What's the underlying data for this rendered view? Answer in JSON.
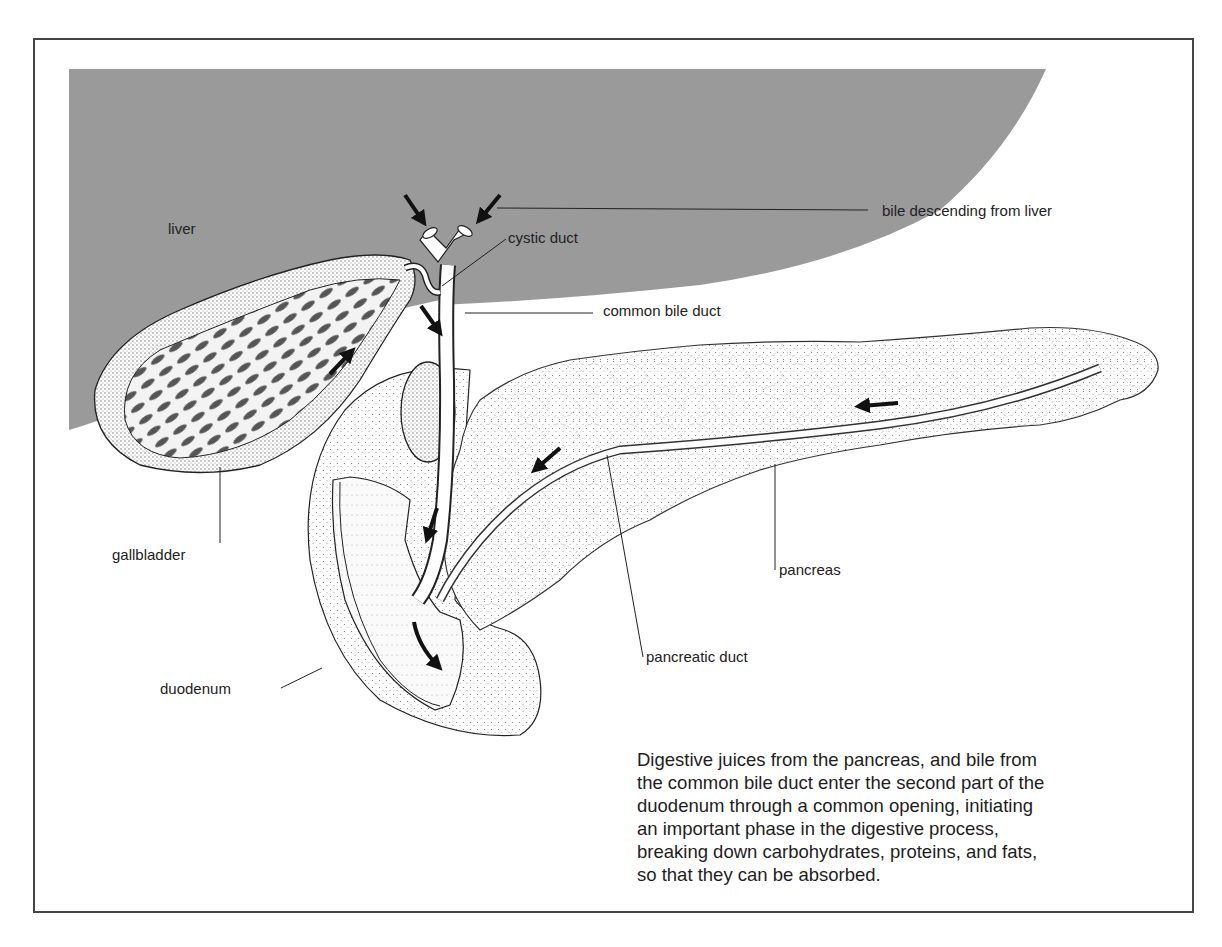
{
  "figure": {
    "colors": {
      "liver_fill": "#9a9a9a",
      "frame": "#444444",
      "ink": "#1e1e1e",
      "stipple": "#6a6a6a",
      "background": "#ffffff"
    },
    "labels": {
      "liver": "liver",
      "bile_descending": "bile descending from liver",
      "cystic_duct": "cystic duct",
      "common_bile_duct": "common bile duct",
      "gallbladder": "gallbladder",
      "pancreas": "pancreas",
      "pancreatic_duct": "pancreatic duct",
      "duodenum": "duodenum"
    },
    "caption": {
      "lines": [
        "Digestive juices from the pancreas, and bile from",
        "the common bile duct enter the second part of the",
        "duodenum through a common opening, initiating",
        "an important phase in the digestive process,",
        "breaking down carbohydrates, proteins, and fats,",
        "so that they can be absorbed."
      ]
    },
    "arrows": [
      {
        "name": "bile-arrow-left-duct",
        "direction": "down-right"
      },
      {
        "name": "bile-arrow-right-duct",
        "direction": "down-left"
      },
      {
        "name": "gallbladder-inflow-arrow",
        "direction": "up-right"
      },
      {
        "name": "common-duct-arrow-upper",
        "direction": "down-right"
      },
      {
        "name": "common-duct-arrow-lower",
        "direction": "down-left"
      },
      {
        "name": "pancreatic-duct-arrow-tail",
        "direction": "left"
      },
      {
        "name": "pancreatic-duct-arrow-head",
        "direction": "down-left"
      },
      {
        "name": "duodenum-outflow-arrow",
        "direction": "curved-down"
      }
    ]
  }
}
